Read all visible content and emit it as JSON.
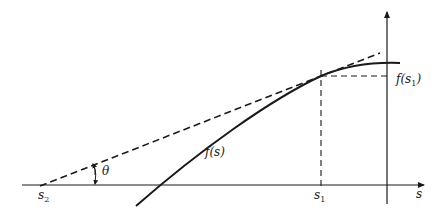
{
  "diagram": {
    "colors": {
      "stroke": "#1a1a1a",
      "background": "#ffffff"
    },
    "labels": {
      "s_axis": "s",
      "s1": "s",
      "s1_sub": "1",
      "s2": "s",
      "s2_sub": "2",
      "theta": "θ",
      "f_s": "f(s)",
      "f_s1_prefix": "f(s",
      "f_s1_sub": "1",
      "f_s1_suffix": ")"
    },
    "elements": [
      {
        "type": "axis",
        "name": "s-axis",
        "direction": "horizontal"
      },
      {
        "type": "axis",
        "name": "vertical-axis",
        "direction": "vertical"
      },
      {
        "type": "curve",
        "name": "f(s)",
        "style": "solid"
      },
      {
        "type": "line",
        "name": "tangent-line",
        "style": "dashed",
        "from": "s2",
        "through": "(s1, f(s1))"
      },
      {
        "type": "line",
        "name": "s1-vertical-guide",
        "style": "dashed"
      },
      {
        "type": "line",
        "name": "f-s1-horizontal-guide",
        "style": "dashed"
      },
      {
        "type": "arc",
        "name": "theta-angle-arc",
        "label": "θ"
      }
    ]
  }
}
